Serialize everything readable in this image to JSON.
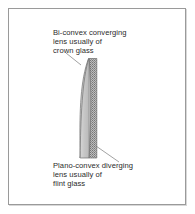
{
  "figure": {
    "background_color": "#ffffff",
    "frame_color": "#9a9a9a",
    "text_color": "#2b2b2b"
  },
  "labels": {
    "top": {
      "name": "bi-convex-converging-lens-label",
      "lines": [
        "Bi-convex converging",
        "lens usually of",
        "crown glass"
      ]
    },
    "bottom": {
      "name": "plano-convex-diverging-lens-label",
      "lines": [
        "Plano-convex diverging",
        "lens usually of",
        "flint glass"
      ]
    }
  },
  "lens_assembly": {
    "crown_element": {
      "name": "crown-glass-lens",
      "shape": "bi-convex",
      "fill_color": "#c9c9c9",
      "outline_color": "#6e6e6e"
    },
    "flint_element": {
      "name": "flint-glass-lens",
      "shape": "plano-concave",
      "fill_color": "#a8a8a8",
      "pattern": "stipple",
      "outline_color": "#6e6e6e"
    }
  },
  "leader_lines": {
    "top": {
      "name": "leader-line-top",
      "from": [
        66,
        53
      ],
      "to": [
        81,
        65
      ],
      "color": "#8a8a8a"
    },
    "bottom": {
      "name": "leader-line-bottom",
      "from": [
        96,
        146
      ],
      "to": [
        119,
        162
      ],
      "color": "#8a8a8a"
    }
  }
}
